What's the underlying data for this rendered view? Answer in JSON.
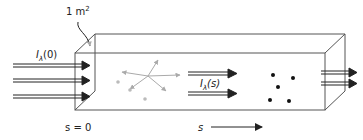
{
  "diagram": {
    "type": "radiative-transfer-slab",
    "labels": {
      "area": "1 m",
      "area_sup": "2",
      "incident_I": "I",
      "incident_sub": "λ",
      "incident_arg": "(0)",
      "internal_I": "I",
      "internal_sub": "λ",
      "internal_arg": "(s)",
      "origin": "s = 0",
      "path_var": "s"
    },
    "colors": {
      "box_edge": "#555555",
      "arrow": "#222222",
      "scatter": "#aaaaaa",
      "absorber": "#111111"
    },
    "elements": {
      "incident_arrows": 3,
      "internal_arrows": 2,
      "exiting_arrows": 2,
      "scattering_center_dots": 3,
      "scatter_rays": 5,
      "absorber_dots": 5
    }
  }
}
